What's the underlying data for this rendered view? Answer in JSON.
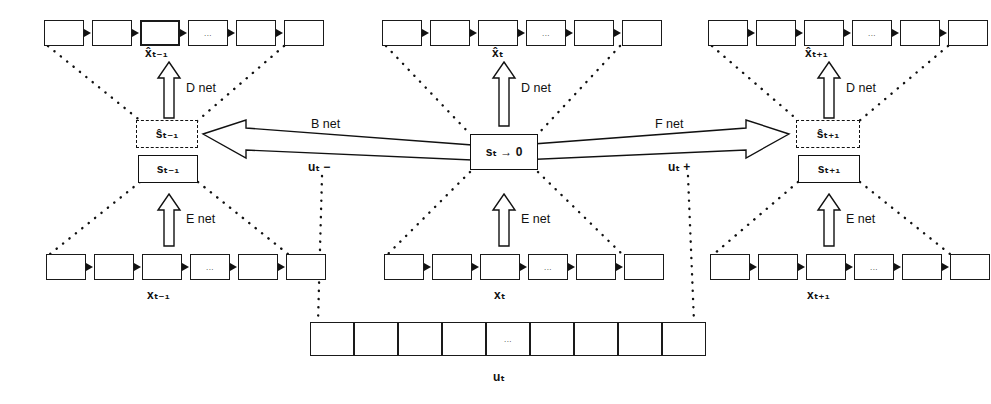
{
  "figure": {
    "title": "Recurrent encoder-decoder state-transition diagram",
    "background": "#ffffff",
    "ink": "#111111"
  },
  "columns": [
    {
      "id": "t-minus-1",
      "output_sequence_label": "x̂ₜ₋₁",
      "input_sequence_label": "xₜ₋₁",
      "predicted_state_label": "ŝₜ₋₁",
      "state_label": "sₜ₋₁",
      "decoder_label": "D net",
      "encoder_label": "E net"
    },
    {
      "id": "t",
      "output_sequence_label": "x̂ₜ",
      "input_sequence_label": "xₜ",
      "state_label": "sₜ → 0",
      "decoder_label": "D net",
      "encoder_label": "E net"
    },
    {
      "id": "t-plus-1",
      "output_sequence_label": "x̂ₜ₊₁",
      "input_sequence_label": "xₜ₊₁",
      "predicted_state_label": "ŝₜ₊₁",
      "state_label": "sₜ₊₁",
      "decoder_label": "D net",
      "encoder_label": "E net"
    }
  ],
  "transitions": {
    "backward": {
      "net_label": "B net",
      "control_label": "uₜ −"
    },
    "forward": {
      "net_label": "F net",
      "control_label": "uₜ +"
    }
  },
  "control_sequence": {
    "label": "uₜ",
    "cells": 9,
    "ellipsis": "...",
    "bidirectional": true
  },
  "sequence_cells": {
    "count": 6,
    "ellipsis": "...",
    "ellipsis_index": 3
  },
  "icons": {
    "up_arrow": "hollow-up-arrow",
    "left_arrow": "hollow-left-arrow",
    "right_arrow": "hollow-right-arrow",
    "chain_link": "chain-link-arrow",
    "dotted_fan": "dotted-fan-connector"
  }
}
